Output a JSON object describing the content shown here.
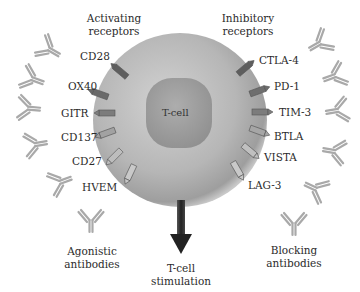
{
  "headers": {
    "activating": [
      "Activating",
      "receptors"
    ],
    "inhibitory": [
      "Inhibitory",
      "receptors"
    ]
  },
  "cell": {
    "label": "T-cell"
  },
  "activating_receptors": [
    "CD28",
    "OX40",
    "GITR",
    "CD137",
    "CD27",
    "HVEM"
  ],
  "inhibitory_receptors": [
    "CTLA-4",
    "PD-1",
    "TIM-3",
    "BTLA",
    "VISTA",
    "LAG-3"
  ],
  "footers": {
    "agonistic": [
      "Agonistic",
      "antibodies"
    ],
    "stimulation": [
      "T-cell",
      "stimulation"
    ],
    "blocking": [
      "Blocking",
      "antibodies"
    ]
  },
  "colors": {
    "cell_outer": "#b4b4b4",
    "nucleus": "#9c9c9c",
    "receptor_dark": "#5a5a5a",
    "receptor_mid": "#7d7d7d",
    "receptor_light": "#c8c8c8",
    "antibody": "#a8a8a8",
    "arrow": "#262626"
  }
}
